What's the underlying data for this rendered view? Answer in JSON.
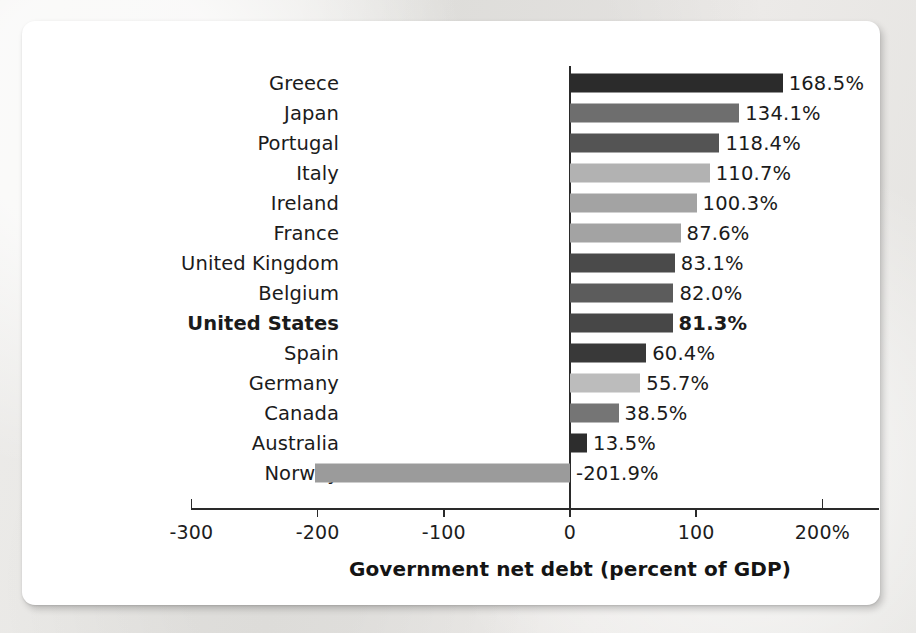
{
  "chart_data": {
    "type": "bar",
    "orientation": "horizontal",
    "title": "",
    "xlabel": "Government net debt (percent of GDP)",
    "ylabel": "",
    "xlim": [
      -300,
      200
    ],
    "grid": false,
    "legend": null,
    "zero_line": 0,
    "x_tick_labels": [
      "-300",
      "-200",
      "-100",
      "0",
      "100",
      "200%"
    ],
    "x_tick_values": [
      -300,
      -200,
      -100,
      0,
      100,
      200
    ],
    "categories": [
      "Greece",
      "Japan",
      "Portugal",
      "Italy",
      "Ireland",
      "France",
      "United Kingdom",
      "Belgium",
      "United States",
      "Spain",
      "Germany",
      "Canada",
      "Australia",
      "Norway"
    ],
    "values": [
      168.5,
      134.1,
      118.4,
      110.7,
      100.3,
      87.6,
      83.1,
      82.0,
      81.3,
      60.4,
      55.7,
      38.5,
      13.5,
      -201.9
    ],
    "value_labels": [
      "168.5%",
      "134.1%",
      "118.4%",
      "110.7%",
      "100.3%",
      "87.6%",
      "83.1%",
      "82.0%",
      "81.3%",
      "60.4%",
      "55.7%",
      "38.5%",
      "13.5%",
      "-201.9%"
    ],
    "bar_colors": [
      "#2b2b2b",
      "#6e6e6e",
      "#545454",
      "#b2b2b2",
      "#a3a3a3",
      "#a3a3a3",
      "#4a4a4a",
      "#5c5c5c",
      "#474747",
      "#393939",
      "#bcbcbc",
      "#757575",
      "#2d2d2d",
      "#9b9b9b"
    ],
    "highlighted_category": "United States"
  },
  "colors": {
    "card_background": "#ffffff",
    "page_background": "#e9e8e6",
    "axis": "#2a2a2a",
    "text": "#1b1b1b"
  }
}
